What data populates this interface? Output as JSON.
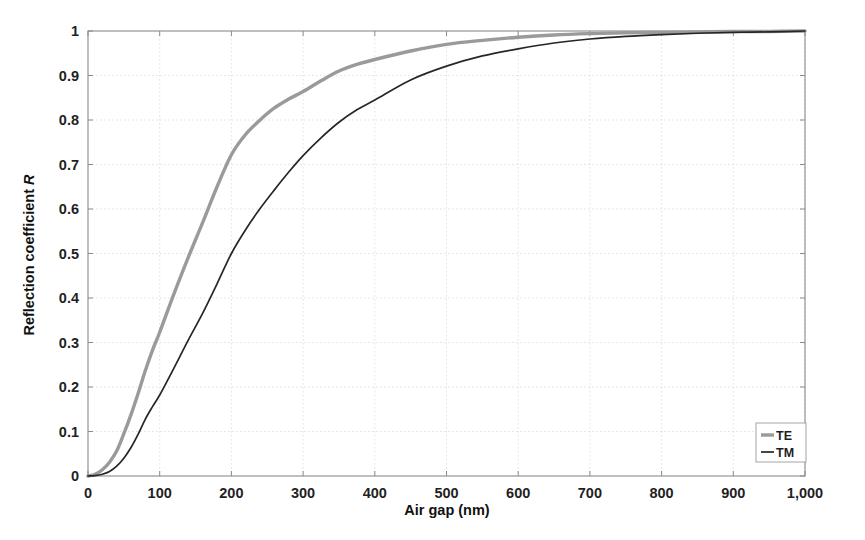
{
  "chart_data": {
    "type": "line",
    "title": "",
    "xlabel": "Air gap (nm)",
    "ylabel": "Reflection coefficient R",
    "ylabel_plain": "Reflection coefficient",
    "ylabel_italic": "R",
    "xlim": [
      0,
      1000
    ],
    "ylim": [
      0,
      1
    ],
    "grid": true,
    "legend_position": "bottom-right",
    "xticks": [
      0,
      100,
      200,
      300,
      400,
      500,
      600,
      700,
      800,
      900,
      1000
    ],
    "xticklabels": [
      "0",
      "100",
      "200",
      "300",
      "400",
      "500",
      "600",
      "700",
      "800",
      "900",
      "1,000"
    ],
    "yticks": [
      0,
      0.1,
      0.2,
      0.3,
      0.4,
      0.5,
      0.6,
      0.7,
      0.8,
      0.9,
      1
    ],
    "yticklabels": [
      "0",
      "0.1",
      "0.2",
      "0.3",
      "0.4",
      "0.5",
      "0.6",
      "0.7",
      "0.8",
      "0.9",
      "1"
    ],
    "x": [
      0,
      10,
      20,
      30,
      40,
      50,
      60,
      70,
      80,
      90,
      100,
      120,
      140,
      160,
      180,
      200,
      220,
      240,
      260,
      280,
      300,
      325,
      350,
      375,
      400,
      450,
      500,
      550,
      600,
      650,
      700,
      750,
      800,
      850,
      900,
      950,
      1000
    ],
    "series": [
      {
        "name": "TE",
        "color": "#9a9a9a",
        "width": 3.4,
        "values": [
          0,
          0.004,
          0.014,
          0.031,
          0.056,
          0.095,
          0.138,
          0.186,
          0.237,
          0.283,
          0.323,
          0.41,
          0.492,
          0.57,
          0.65,
          0.722,
          0.768,
          0.8,
          0.827,
          0.847,
          0.864,
          0.888,
          0.91,
          0.925,
          0.936,
          0.955,
          0.97,
          0.979,
          0.986,
          0.991,
          0.994,
          0.996,
          0.997,
          0.998,
          0.999,
          0.999,
          1.0
        ]
      },
      {
        "name": "TM",
        "color": "#262626",
        "width": 1.7,
        "values": [
          0,
          0.001,
          0.004,
          0.01,
          0.022,
          0.04,
          0.064,
          0.094,
          0.128,
          0.156,
          0.182,
          0.243,
          0.306,
          0.366,
          0.432,
          0.5,
          0.554,
          0.601,
          0.643,
          0.683,
          0.72,
          0.76,
          0.795,
          0.823,
          0.845,
          0.89,
          0.921,
          0.944,
          0.96,
          0.973,
          0.982,
          0.988,
          0.992,
          0.995,
          0.997,
          0.998,
          1.0
        ]
      }
    ]
  },
  "legend": {
    "items": [
      {
        "label": "TE"
      },
      {
        "label": "TM"
      }
    ]
  },
  "colors": {
    "te_line": "#9a9a9a",
    "tm_line": "#262626",
    "grid": "#dcdcdc",
    "axis": "#8a8a8a",
    "background": "#ffffff"
  }
}
